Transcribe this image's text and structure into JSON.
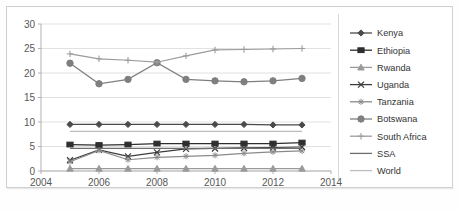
{
  "chart_data": {
    "type": "line",
    "title": "",
    "subtitle": "",
    "xlabel": "",
    "ylabel": "",
    "xlim": [
      2004,
      2014
    ],
    "ylim": [
      0,
      30
    ],
    "yticks": [
      0,
      5,
      10,
      15,
      20,
      25,
      30
    ],
    "xticks": [
      2004,
      2006,
      2008,
      2010,
      2012,
      2014
    ],
    "grid": true,
    "legend_position": "right",
    "x": [
      2005,
      2006,
      2007,
      2008,
      2009,
      2010,
      2011,
      2012,
      2013
    ],
    "series": [
      {
        "name": "Kenya",
        "marker": "diamond",
        "color": "#4a4a4a",
        "values": [
          9.5,
          9.5,
          9.5,
          9.5,
          9.5,
          9.5,
          9.5,
          9.4,
          9.4
        ]
      },
      {
        "name": "Ethiopia",
        "marker": "square",
        "color": "#2e2e2e",
        "values": [
          5.4,
          5.3,
          5.4,
          5.6,
          5.6,
          5.6,
          5.6,
          5.6,
          5.8
        ]
      },
      {
        "name": "Rwanda",
        "marker": "triangle",
        "color": "#9a9a9a",
        "values": [
          0.5,
          0.5,
          0.5,
          0.5,
          0.5,
          0.5,
          0.5,
          0.5,
          0.5
        ]
      },
      {
        "name": "Uganda",
        "marker": "cross",
        "color": "#3c3c3c",
        "values": [
          2.2,
          4.3,
          3.0,
          3.8,
          4.5,
          4.6,
          4.7,
          4.8,
          4.9
        ]
      },
      {
        "name": "Tanzania",
        "marker": "star",
        "color": "#8a8a8a",
        "values": [
          1.9,
          4.2,
          2.3,
          2.8,
          3.0,
          3.2,
          3.6,
          3.9,
          4.1
        ]
      },
      {
        "name": "Botswana",
        "marker": "circle",
        "color": "#7f7f7f",
        "values": [
          22.0,
          17.8,
          18.7,
          22.1,
          18.7,
          18.4,
          18.2,
          18.4,
          18.9
        ]
      },
      {
        "name": "South Africa",
        "marker": "plus",
        "color": "#9c9c9c",
        "values": [
          23.9,
          22.9,
          22.6,
          22.2,
          23.5,
          24.7,
          24.8,
          24.9,
          25.0
        ]
      },
      {
        "name": "SSA",
        "marker": "none",
        "color": "#6e6e6e",
        "values": [
          4.6,
          4.6,
          4.6,
          4.6,
          4.6,
          4.6,
          4.6,
          4.6,
          4.6
        ]
      },
      {
        "name": "World",
        "marker": "none",
        "color": "#bdbdbd",
        "values": [
          8.1,
          8.1,
          8.1,
          8.1,
          8.1,
          8.1,
          8.1,
          8.1,
          8.1
        ]
      }
    ]
  },
  "axis": {
    "y_tick_labels": [
      "0",
      "5",
      "10",
      "15",
      "20",
      "25",
      "30"
    ],
    "x_tick_labels": [
      "2004",
      "2006",
      "2008",
      "2010",
      "2012",
      "2014"
    ]
  },
  "legend": {
    "items": [
      {
        "label": "Kenya"
      },
      {
        "label": "Ethiopia"
      },
      {
        "label": "Rwanda"
      },
      {
        "label": "Uganda"
      },
      {
        "label": "Tanzania"
      },
      {
        "label": "Botswana"
      },
      {
        "label": "South Africa"
      },
      {
        "label": "SSA"
      },
      {
        "label": "World"
      }
    ]
  }
}
